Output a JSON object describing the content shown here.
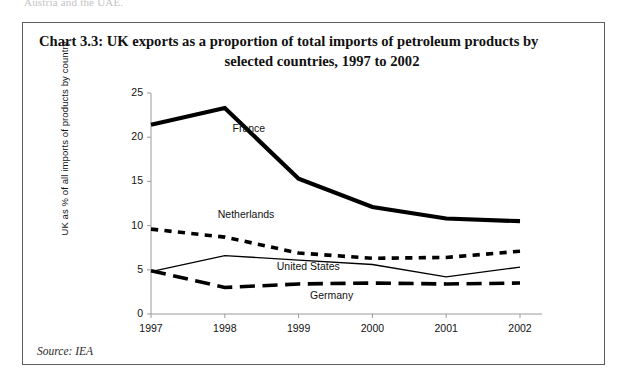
{
  "page": {
    "top_cut_text": "Austria and the UAE."
  },
  "chart_box": {
    "title_line1": "Chart 3.3: UK exports as a proportion of total imports of petroleum products by",
    "title_line2": "selected countries, 1997 to 2002",
    "source": "Source: IEA"
  },
  "chart_data": {
    "type": "line",
    "title": "Chart 3.3: UK exports as a proportion of total imports of petroleum products by selected countries, 1997 to 2002",
    "xlabel": "",
    "ylabel": "UK as % of all imports of products by country",
    "x": [
      "1997",
      "1998",
      "1999",
      "2000",
      "2001",
      "2002"
    ],
    "categories": [
      "1997",
      "1998",
      "1999",
      "2000",
      "2001",
      "2002"
    ],
    "xticklabels": [
      "1997",
      "1998",
      "1999",
      "2000",
      "2001",
      "2002"
    ],
    "yticklabels": [
      "0",
      "5",
      "10",
      "15",
      "20",
      "25"
    ],
    "yticks": [
      0,
      5,
      10,
      15,
      20,
      25
    ],
    "ylim": [
      0,
      25
    ],
    "grid": false,
    "legend": "inline-labels",
    "series": [
      {
        "name": "France",
        "values": [
          21.4,
          23.3,
          15.3,
          12.1,
          10.8,
          10.5
        ],
        "style": "solid",
        "width": 4.2,
        "color": "#000000",
        "label_x": 1.05,
        "label_y": 20.9
      },
      {
        "name": "Netherlands",
        "values": [
          9.6,
          8.7,
          6.9,
          6.3,
          6.4,
          7.1
        ],
        "style": "short-dash",
        "width": 3.6,
        "color": "#000000",
        "label_x": 0.85,
        "label_y": 11.2
      },
      {
        "name": "United States",
        "values": [
          4.8,
          6.6,
          6.1,
          5.6,
          4.2,
          5.3
        ],
        "style": "solid",
        "width": 1.3,
        "color": "#000000",
        "label_x": 1.65,
        "label_y": 5.3
      },
      {
        "name": "Germany",
        "values": [
          4.9,
          3.0,
          3.4,
          3.5,
          3.4,
          3.5
        ],
        "style": "long-dash",
        "width": 3.6,
        "color": "#000000",
        "label_x": 2.1,
        "label_y": 2.0
      }
    ],
    "annotations": [
      {
        "text": "Source: IEA"
      }
    ]
  }
}
